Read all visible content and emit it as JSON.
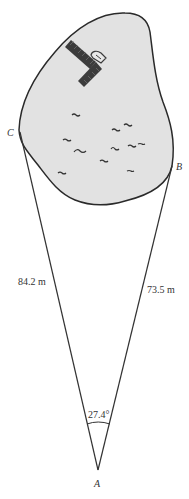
{
  "diagram": {
    "points": {
      "A": {
        "label": "A"
      },
      "B": {
        "label": "B"
      },
      "C": {
        "label": "C"
      }
    },
    "sides": {
      "AC": {
        "label": "84.2 m",
        "value": 84.2,
        "unit": "m"
      },
      "AB": {
        "label": "73.5 m",
        "value": 73.5,
        "unit": "m"
      }
    },
    "angle_A": {
      "label": "27.4°",
      "value": 27.4,
      "unit": "degrees"
    },
    "features": [
      "lake",
      "dock",
      "boat",
      "water-ripples"
    ],
    "colors": {
      "lake_fill": "#e2e2e2",
      "outline": "#2a2a2a",
      "dock": "#3c3c3c",
      "line": "#333333"
    }
  }
}
